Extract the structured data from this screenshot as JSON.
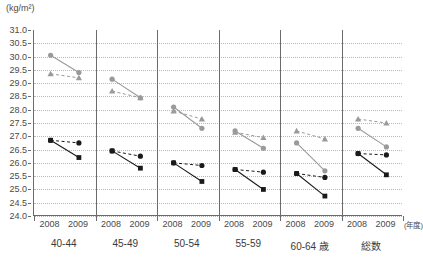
{
  "chart_data": {
    "type": "line",
    "title": "",
    "subtitle": "",
    "xlabel": "(年度)",
    "ylabel": "(kg/m²)",
    "ylim": [
      24.0,
      31.0
    ],
    "ytick_step": 0.5,
    "grid": true,
    "legend_position": "none",
    "x": [
      "2008",
      "2009"
    ],
    "categories": [
      "40-44",
      "45-49",
      "50-54",
      "55-59",
      "60-64 歳",
      "総数"
    ],
    "group_axis_note": "歳",
    "yticks": [
      "31.0",
      "30.5",
      "30.0",
      "29.5",
      "29.0",
      "28.5",
      "28.0",
      "27.5",
      "27.0",
      "26.5",
      "26.0",
      "25.5",
      "25.0",
      "24.5",
      "24.0"
    ],
    "series": [
      {
        "name": "gray-circle-solid",
        "marker": "circle",
        "line": "solid",
        "color": "#9a9a9a",
        "values_by_group": [
          [
            30.05,
            29.4
          ],
          [
            29.15,
            28.45
          ],
          [
            28.1,
            27.3
          ],
          [
            27.2,
            26.55
          ],
          [
            26.75,
            25.7
          ],
          [
            27.3,
            26.6
          ]
        ]
      },
      {
        "name": "gray-triangle-dashed",
        "marker": "triangle",
        "line": "dashed",
        "color": "#9a9a9a",
        "values_by_group": [
          [
            29.35,
            29.2
          ],
          [
            28.7,
            28.45
          ],
          [
            27.95,
            27.65
          ],
          [
            27.15,
            26.95
          ],
          [
            27.2,
            26.9
          ],
          [
            27.65,
            27.5
          ]
        ]
      },
      {
        "name": "black-square-solid",
        "marker": "square",
        "line": "solid",
        "color": "#1a1a1a",
        "values_by_group": [
          [
            26.85,
            26.2
          ],
          [
            26.45,
            25.8
          ],
          [
            26.0,
            25.3
          ],
          [
            25.75,
            25.0
          ],
          [
            25.6,
            24.75
          ],
          [
            26.35,
            25.55
          ]
        ]
      },
      {
        "name": "black-circle-dashed",
        "marker": "circle",
        "line": "dashed",
        "color": "#1a1a1a",
        "values_by_group": [
          [
            26.85,
            26.75
          ],
          [
            26.45,
            26.25
          ],
          [
            26.0,
            25.9
          ],
          [
            25.75,
            25.65
          ],
          [
            25.6,
            25.45
          ],
          [
            26.35,
            26.3
          ]
        ]
      }
    ]
  },
  "axis": {
    "unit": "(kg/m²)",
    "year_note": "(年度)"
  }
}
